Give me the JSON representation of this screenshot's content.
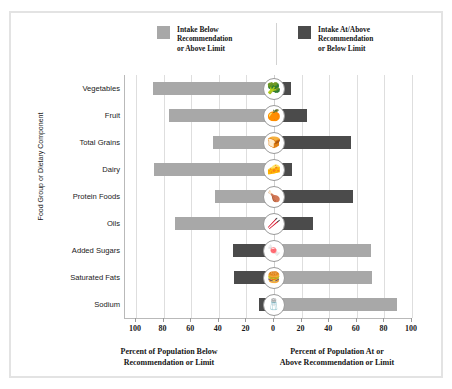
{
  "legend": {
    "below": {
      "label": "Intake Below\nRecommendation\nor Above Limit",
      "color": "#a8a8a8",
      "icon": "legend-swatch-light"
    },
    "atabove": {
      "label": "Intake At/Above\nRecommendation\nor Below Limit",
      "color": "#4b4b4b",
      "icon": "legend-swatch-dark"
    }
  },
  "axes": {
    "y_title": "Food Group or Dietary Component",
    "caption_left": "Percent of Population Below\nRecommendation or Limit",
    "caption_right": "Percent of Population At or\nAbove Recommendation or Limit",
    "ticks": [
      "100",
      "80",
      "60",
      "40",
      "20",
      "0",
      "20",
      "40",
      "60",
      "80",
      "100"
    ]
  },
  "chart_data": {
    "type": "bar",
    "title": "",
    "subtype": "diverging-horizontal-bar",
    "xlabel_left": "Percent of Population Below Recommendation or Limit",
    "xlabel_right": "Percent of Population At or Above Recommendation or Limit",
    "ylabel": "Food Group or Dietary Component",
    "xlim": [
      -100,
      100
    ],
    "xticks": [
      -100,
      -80,
      -60,
      -40,
      -20,
      0,
      20,
      40,
      60,
      80,
      100
    ],
    "xticklabels": [
      "100",
      "80",
      "60",
      "40",
      "20",
      "0",
      "20",
      "40",
      "60",
      "80",
      "100"
    ],
    "grid": true,
    "legend_position": "top",
    "categories": [
      "Vegetables",
      "Fruit",
      "Total Grains",
      "Dairy",
      "Protein Foods",
      "Oils",
      "Added Sugars",
      "Saturated Fats",
      "Sodium"
    ],
    "series": [
      {
        "name": "Intake Below Recommendation or Above Limit",
        "color": "#a8a8a8",
        "side": "varies",
        "values": [
          88,
          76,
          44,
          87,
          43,
          72,
          70,
          71,
          89
        ]
      },
      {
        "name": "Intake At/Above Recommendation or Below Limit",
        "color": "#4b4b4b",
        "side": "varies",
        "values": [
          12,
          24,
          56,
          13,
          57,
          28,
          30,
          29,
          11
        ]
      }
    ],
    "rows": [
      {
        "category": "Vegetables",
        "icon": "broccoli-icon",
        "left_value": 88,
        "left_series": "below",
        "right_value": 12,
        "right_series": "atabove"
      },
      {
        "category": "Fruit",
        "icon": "fruit-icon",
        "left_value": 76,
        "left_series": "below",
        "right_value": 24,
        "right_series": "atabove"
      },
      {
        "category": "Total Grains",
        "icon": "grains-icon",
        "left_value": 44,
        "left_series": "below",
        "right_value": 56,
        "right_series": "atabove"
      },
      {
        "category": "Dairy",
        "icon": "dairy-icon",
        "left_value": 87,
        "left_series": "below",
        "right_value": 13,
        "right_series": "atabove"
      },
      {
        "category": "Protein Foods",
        "icon": "protein-icon",
        "left_value": 43,
        "left_series": "below",
        "right_value": 57,
        "right_series": "atabove"
      },
      {
        "category": "Oils",
        "icon": "oils-icon",
        "left_value": 72,
        "left_series": "below",
        "right_value": 28,
        "right_series": "atabove"
      },
      {
        "category": "Added Sugars",
        "icon": "added-sugars-icon",
        "left_value": 30,
        "left_series": "atabove",
        "right_value": 70,
        "right_series": "below"
      },
      {
        "category": "Saturated Fats",
        "icon": "saturated-fats-icon",
        "left_value": 29,
        "left_series": "atabove",
        "right_value": 71,
        "right_series": "below"
      },
      {
        "category": "Sodium",
        "icon": "sodium-icon",
        "left_value": 11,
        "left_series": "atabove",
        "right_value": 89,
        "right_series": "below"
      }
    ]
  }
}
